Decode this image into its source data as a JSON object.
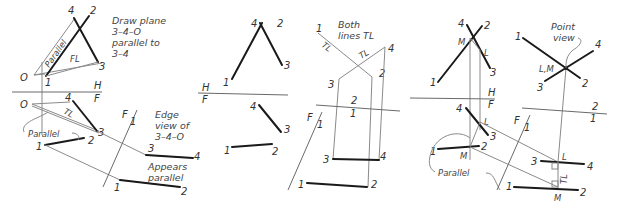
{
  "figure": {
    "panels": [
      {
        "id": "panel-1",
        "notes": {
          "draw_plane": [
            "Draw plane",
            "3–4–O",
            "parallel to",
            "3–4"
          ],
          "parallel_top": "Parallel",
          "fl": "FL",
          "edge_view": [
            "Edge",
            "view of",
            "3–4–O"
          ],
          "parallel_bottom": "Parallel",
          "tl": "TL",
          "appears_parallel": [
            "Appears",
            "parallel"
          ]
        },
        "labels": {
          "top": {
            "p4": "4",
            "p2": "2",
            "p3": "3",
            "p1": "1",
            "o": "O"
          },
          "front": {
            "p4": "4",
            "p3": "3",
            "p2": "2",
            "p1": "1",
            "o": "O"
          },
          "aux": {
            "p3": "3",
            "p4": "4",
            "p1": "1",
            "p2": "2"
          },
          "hf_h": "H",
          "hf_f": "F",
          "f1_f": "F",
          "f1_1": "1"
        }
      },
      {
        "id": "panel-2",
        "labels": {
          "top": {
            "p4": "4",
            "p2": "2",
            "p3": "3",
            "p1": "1"
          },
          "front": {
            "p4": "4",
            "p3": "3",
            "p1": "1",
            "p2": "2"
          },
          "hf_h": "H",
          "hf_f": "F"
        }
      },
      {
        "id": "panel-3",
        "notes": {
          "both_lines": [
            "Both",
            "lines TL"
          ],
          "tl1": "TL",
          "tl2": "TL"
        },
        "labels": {
          "aux1": {
            "p1": "1",
            "p4": "4",
            "p3": "3",
            "p2": "2"
          },
          "ref_2": "2",
          "ref_1": "1",
          "front": {
            "p3": "3",
            "p4": "4",
            "p1": "1",
            "p2": "2"
          },
          "f1_f": "F",
          "f1_1": "1"
        }
      },
      {
        "id": "panel-4",
        "notes": {
          "point_view": [
            "Point",
            "view"
          ],
          "parallel": "Parallel",
          "tl": "TL"
        },
        "labels": {
          "top": {
            "p4": "4",
            "p2": "2",
            "m": "M",
            "l": "L",
            "p3": "3",
            "p1": "1"
          },
          "front": {
            "p4": "4",
            "l": "L",
            "p3": "3",
            "p2": "2",
            "p1": "1",
            "m": "M"
          },
          "hf_h": "H",
          "hf_f": "F",
          "aux1": {
            "p3": "3",
            "l": "L",
            "p4": "4",
            "p1": "1",
            "m": "M",
            "p2": "2"
          },
          "f1_f": "F",
          "f1_1": "1",
          "aux2": {
            "p1": "1",
            "p4": "4",
            "lm": "L,M",
            "p3": "3",
            "p2": "2"
          },
          "ref_2": "2",
          "ref_1": "1"
        }
      }
    ],
    "colors": {
      "ink": "#1a1a1a",
      "construction": "#8a8a8a",
      "text": "#333333",
      "background": "#ffffff"
    }
  }
}
